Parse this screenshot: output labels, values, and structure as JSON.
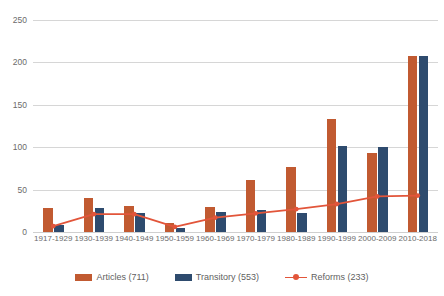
{
  "chart_data": {
    "type": "bar",
    "title": "",
    "xlabel": "",
    "ylabel": "",
    "ylim": [
      0,
      250
    ],
    "yticks": [
      0,
      50,
      100,
      150,
      200,
      250
    ],
    "grid": true,
    "legend_position": "bottom",
    "categories": [
      "1917-1929",
      "1930-1939",
      "1940-1949",
      "1950-1959",
      "1960-1969",
      "1970-1979",
      "1980-1989",
      "1990-1999",
      "2000-2009",
      "2010-2018"
    ],
    "series": [
      {
        "name": "Articles (711)",
        "type": "bar",
        "color": "#C15A31",
        "values": [
          28,
          40,
          31,
          11,
          30,
          61,
          77,
          133,
          93,
          208
        ]
      },
      {
        "name": "Transitory (553)",
        "type": "bar",
        "color": "#2E4B6E",
        "values": [
          8,
          28,
          22,
          5,
          24,
          26,
          22,
          102,
          100,
          207
        ]
      },
      {
        "name": "Reforms (233)",
        "type": "line",
        "color": "#E2553A",
        "values": [
          7,
          21,
          21,
          6,
          17,
          22,
          27,
          33,
          42,
          43
        ]
      }
    ]
  },
  "legend": {
    "items": [
      {
        "label": "Articles (711)",
        "marker": "bar",
        "color": "#C15A31"
      },
      {
        "label": "Transitory (553)",
        "marker": "bar",
        "color": "#2E4B6E"
      },
      {
        "label": "Reforms (233)",
        "marker": "line",
        "color": "#E2553A"
      }
    ]
  }
}
